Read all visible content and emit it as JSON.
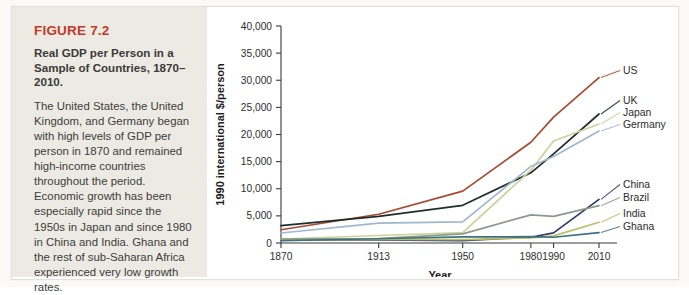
{
  "figure": {
    "number_label": "FIGURE 7.2",
    "title": "Real GDP per Person in a Sample of Countries, 1870–2010.",
    "caption": "The United States, the United Kingdom, and Germany began with high levels of GDP per person in 1870 and remained high-income countries throughout the period. Economic growth has been especially rapid since the 1950s in Japan and since 1980 in China and India. Ghana and the rest of sub-Saharan Africa experienced very low growth rates.",
    "accent_color": "#c0392b",
    "panel_color": "#eceae2"
  },
  "chart_data": {
    "type": "line",
    "title": "Real GDP per Person in a Sample of Countries, 1870–2010",
    "xlabel": "Year",
    "ylabel": "1990 international $/person",
    "x": [
      1870,
      1913,
      1950,
      1980,
      1990,
      2010
    ],
    "xticklabels": [
      "1870",
      "1913",
      "1950",
      "1980",
      "1990",
      "2010"
    ],
    "yticklabels": [
      "0",
      "5,000",
      "10,000",
      "15,000",
      "20,000",
      "25,000",
      "30,000",
      "35,000",
      "40,000"
    ],
    "yticks": [
      0,
      5000,
      10000,
      15000,
      20000,
      25000,
      30000,
      35000,
      40000
    ],
    "ylim": [
      0,
      40000
    ],
    "grid": false,
    "legend_position": "right-inline",
    "series": [
      {
        "name": "US",
        "color": "#a8492f",
        "values": [
          2445,
          5301,
          9561,
          18577,
          23201,
          30491
        ]
      },
      {
        "name": "UK",
        "color": "#1f2d2b",
        "values": [
          3190,
          4921,
          6939,
          12931,
          16430,
          23777
        ]
      },
      {
        "name": "Japan",
        "color": "#cdd29a",
        "values": [
          737,
          1387,
          1921,
          13428,
          18789,
          21935
        ]
      },
      {
        "name": "Germany",
        "color": "#9fb8cd",
        "values": [
          1839,
          3648,
          3881,
          14114,
          15929,
          20661
        ]
      },
      {
        "name": "China",
        "color": "#2e3a6b",
        "values": [
          530,
          552,
          448,
          1061,
          1871,
          8032
        ]
      },
      {
        "name": "Brazil",
        "color": "#8a9b8a",
        "values": [
          713,
          811,
          1672,
          5195,
          4920,
          6879
        ]
      },
      {
        "name": "India",
        "color": "#b9bf6a",
        "values": [
          533,
          673,
          619,
          938,
          1309,
          3826
        ]
      },
      {
        "name": "Ghana",
        "color": "#3f6f80",
        "values": [
          439,
          781,
          1122,
          1157,
          1063,
          1922
        ]
      }
    ]
  }
}
